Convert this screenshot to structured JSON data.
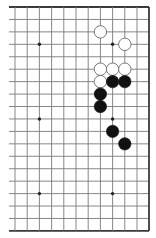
{
  "diagram": {
    "type": "go-board-partial",
    "board_size": 19,
    "visible_columns": 12,
    "visible_rows": 19,
    "edges": {
      "top": true,
      "right": true,
      "bottom": true,
      "left": false
    },
    "grid": {
      "x_lines": [
        15,
        27.2,
        39.4,
        51.6,
        63.8,
        76,
        88.2,
        100.4,
        112.6,
        124.8,
        137,
        149
      ],
      "y_start": 7,
      "y_step": 12.44,
      "line_color": "#7a7a7a",
      "edge_color": "#3a3a3a",
      "left_overhang_x": 9
    },
    "star_points": [
      {
        "col": 2,
        "row": 3
      },
      {
        "col": 8,
        "row": 3
      },
      {
        "col": 2,
        "row": 9
      },
      {
        "col": 8,
        "row": 9
      },
      {
        "col": 2,
        "row": 15
      },
      {
        "col": 8,
        "row": 15
      }
    ],
    "stones": [
      {
        "color": "white",
        "col": 7,
        "row": 2
      },
      {
        "color": "white",
        "col": 9,
        "row": 3
      },
      {
        "color": "white",
        "col": 7,
        "row": 5
      },
      {
        "color": "white",
        "col": 8,
        "row": 5
      },
      {
        "color": "white",
        "col": 9,
        "row": 5
      },
      {
        "color": "white",
        "col": 7,
        "row": 6
      },
      {
        "color": "black",
        "col": 8,
        "row": 6
      },
      {
        "color": "black",
        "col": 9,
        "row": 6
      },
      {
        "color": "black",
        "col": 7,
        "row": 7
      },
      {
        "color": "black",
        "col": 7,
        "row": 8
      },
      {
        "color": "black",
        "col": 8,
        "row": 10
      },
      {
        "color": "black",
        "col": 9,
        "row": 11
      }
    ],
    "stone_colors": {
      "black": "#111111",
      "white": "#ffffff",
      "white_outline": "#6a6a6a"
    },
    "stone_radius": 6.2
  }
}
